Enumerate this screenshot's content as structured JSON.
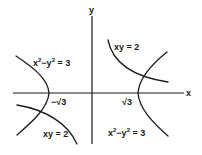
{
  "diagram": {
    "axes": {
      "x_label": "x",
      "y_label": "y"
    },
    "ticks": {
      "neg_sqrt3": "−√3",
      "pos_sqrt3": "√3"
    },
    "curves": [
      {
        "id": "hyperbola-diff",
        "equation": "x² − y² = 3",
        "parts": {
          "base1": "x",
          "exp1": "2",
          "minus": "−y",
          "exp2": "2",
          "rest": " = 3"
        }
      },
      {
        "id": "hyperbola-prod",
        "equation": "xy = 2",
        "label": "xy = 2"
      }
    ],
    "labels": {
      "top_left": {
        "x": "x",
        "x_exp": "2",
        "mid": "−y",
        "y_exp": "2",
        "tail": " = 3"
      },
      "top_right": "xy = 2",
      "bottom_left": "xy = 2",
      "bottom_right": {
        "x": "x",
        "x_exp": "2",
        "mid": "−y",
        "y_exp": "2",
        "tail": " = 3"
      }
    },
    "colors": {
      "ink": "#1a1a1a",
      "background": "#ffffff"
    }
  }
}
